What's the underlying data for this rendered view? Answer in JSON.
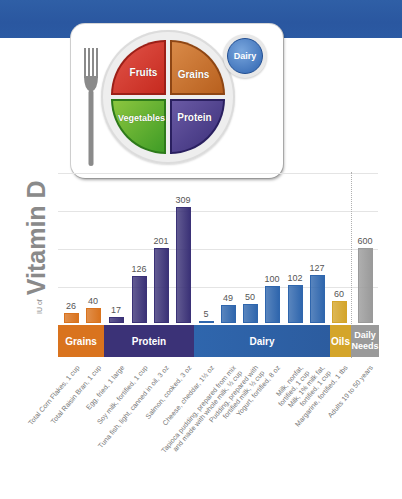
{
  "plate": {
    "fruits": "Fruits",
    "grains": "Grains",
    "vegetables": "Vegetables",
    "protein": "Protein",
    "dairy": "Dairy"
  },
  "colors": {
    "header_blue": "#2b5aa3",
    "grains": "#d9731e",
    "protein": "#3b3277",
    "dairy": "#2f66ad",
    "oils": "#d4a52a",
    "daily_needs": "#9a9a9a"
  },
  "chart_data": {
    "type": "bar",
    "title": "",
    "ylabel": "IU of Vitamin D",
    "ylabel_unit": "IU of",
    "ylabel_main": "Vitamin D",
    "xlabel": "",
    "grid": true,
    "categories": [
      "Total Corn Flakes, 1 cup",
      "Total Raisin Bran, 1 cup",
      "Egg, fried, 1 large",
      "Soy milk, fortified, 1 cup",
      "Tuna fish, light, canned in oil, 3 oz",
      "Salmon, cooked, 3 oz",
      "Cheese, cheddar, 1½ oz",
      "Tapioca pudding, prepared from mix\nand made with whole milk, ½ cup",
      "Pudding, prepared with\nfortified milk, ½ cup",
      "Yogurt, fortified, 8 oz",
      "Milk, nonfat,\nfortified, 1 cup",
      "Milk, 1% milk fat,\nfortified, 1 cup",
      "Margarine, fortified, 1 tbs",
      "Adults 19 to 50 years"
    ],
    "values": [
      26,
      40,
      17,
      126,
      201,
      309,
      5,
      49,
      50,
      100,
      102,
      127,
      60,
      600
    ],
    "groups": [
      {
        "name": "Grains",
        "indices": [
          0,
          1
        ],
        "color": "#d9731e"
      },
      {
        "name": "Protein",
        "indices": [
          2,
          3,
          4,
          5
        ],
        "color": "#3b3277"
      },
      {
        "name": "Dairy",
        "indices": [
          6,
          7,
          8,
          9,
          10,
          11
        ],
        "color": "#2f66ad"
      },
      {
        "name": "Oils",
        "indices": [
          12
        ],
        "color": "#d4a52a"
      },
      {
        "name": "Daily Needs",
        "indices": [
          13
        ],
        "color": "#9a9a9a"
      }
    ]
  },
  "bands": {
    "grains": "Grains",
    "protein": "Protein",
    "dairy": "Dairy",
    "oils": "Oils",
    "daily_needs": "Daily Needs"
  }
}
